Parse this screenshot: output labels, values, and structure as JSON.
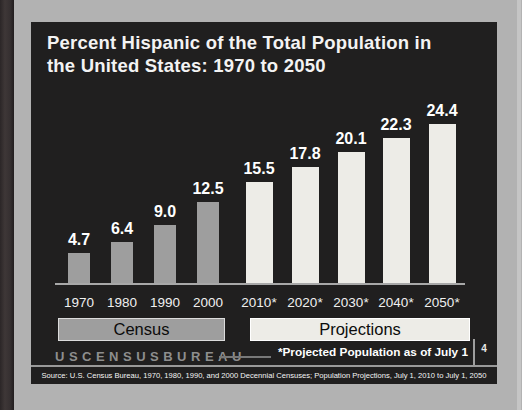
{
  "slide": {
    "page_number": "4",
    "logo": "USCENSUSBUREAU",
    "footnote": "*Projected Population as of July 1",
    "source": "Source: U.S. Census Bureau, 1970, 1980, 1990, and 2000 Decennial Censuses; Population Projections, July 1, 2010 to July 1, 2050"
  },
  "chart_data": {
    "type": "bar",
    "title": "Percent Hispanic of the Total Population in the United States: 1970 to 2050",
    "title_lines": [
      "Percent Hispanic of the Total Population in",
      "the United States: 1970 to 2050"
    ],
    "categories": [
      "1970",
      "1980",
      "1990",
      "2000",
      "2010*",
      "2020*",
      "2030*",
      "2040*",
      "2050*"
    ],
    "values": [
      4.7,
      6.4,
      9.0,
      12.5,
      15.5,
      17.8,
      20.1,
      22.3,
      24.4
    ],
    "value_labels": [
      "4.7",
      "6.4",
      "9.0",
      "12.5",
      "15.5",
      "17.8",
      "20.1",
      "22.3",
      "24.4"
    ],
    "groups": [
      {
        "label": "Census",
        "categories": [
          "1970",
          "1980",
          "1990",
          "2000"
        ]
      },
      {
        "label": "Projections",
        "categories": [
          "2010*",
          "2020*",
          "2030*",
          "2040*",
          "2050*"
        ]
      }
    ],
    "xlabel": "",
    "ylabel": "",
    "unit": "percent",
    "ylim": [
      0,
      26
    ],
    "grid": false,
    "legend": "none",
    "colors": {
      "census_bar": "#9e9e9e",
      "projection_bar": "#edece7",
      "panel_background": "#201f1f",
      "slide_background": "#b2b2b2",
      "value_label": "#ffffff"
    }
  }
}
